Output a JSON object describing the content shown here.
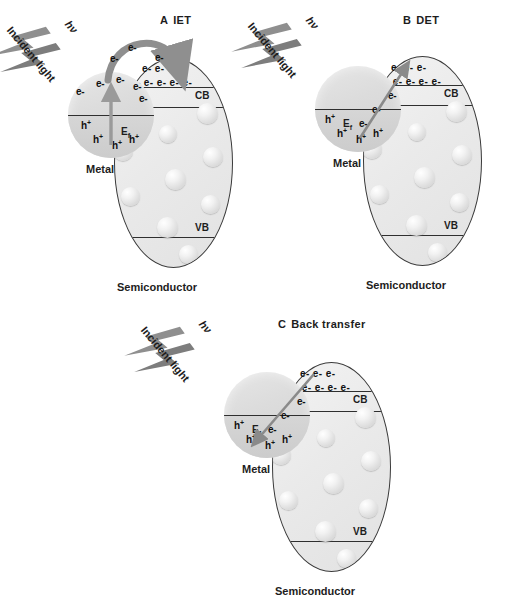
{
  "figure": {
    "common": {
      "incident_light_label": "Incident light",
      "photon_label": "hν",
      "metal_label": "Metal",
      "semiconductor_label": "Semiconductor",
      "fermi_label": "E",
      "fermi_sub": "f",
      "cb_label": "CB",
      "vb_label": "VB",
      "electron_label": "e-",
      "hole_label": "h",
      "hole_sup": "+",
      "colors": {
        "beam_gray": "#8a8a8a",
        "beam_gray_dark": "#6f6f6f",
        "arrow_gray": "#8f8f8f",
        "arrow_gray_dark": "#7a7a7a",
        "outline": "#3a3a3a",
        "band_line": "#2f2f2f",
        "text": "#1d1d1d",
        "metal_fill": "#dcdcdc",
        "semi_fill": "#ececec"
      }
    },
    "panels": [
      {
        "id": "A",
        "letter": "A",
        "name": "IET",
        "title": "IET",
        "mechanism": "indirect electron transfer",
        "arrow_type": "curved-arc-over-top",
        "metal_electrons": [
          "e-",
          "e-",
          "e-",
          "e-",
          "e-"
        ],
        "metal_holes": [
          "h+",
          "h+",
          "h+",
          "h+"
        ],
        "arc_electrons": [
          "e-",
          "e-",
          "e-"
        ],
        "cb_row_top": "e- e- e-",
        "cb_row_bottom": "e- e- e- e- e-"
      },
      {
        "id": "B",
        "letter": "B",
        "name": "DET",
        "title": "DET",
        "mechanism": "direct electron transfer",
        "arrow_type": "straight-diagonal-up-right",
        "metal_electrons": [
          "e-",
          "e-",
          "e-"
        ],
        "metal_holes": [
          "h+",
          "h+",
          "h+",
          "h+"
        ],
        "arc_electrons": [],
        "cb_row_top": "e- e- e-",
        "cb_row_bottom": "e- e- e- e- e-"
      },
      {
        "id": "C",
        "letter": "C",
        "name": "Back transfer",
        "title": "Back transfer",
        "mechanism": "back electron transfer to metal",
        "arrow_type": "straight-diagonal-down-left",
        "metal_electrons": [
          "e-",
          "e-",
          "e-"
        ],
        "metal_holes": [
          "h+",
          "h+",
          "h+",
          "h+"
        ],
        "arc_electrons": [],
        "cb_row_top": "e- e- e-",
        "cb_row_bottom": "e- e- e- e- e-"
      }
    ]
  }
}
